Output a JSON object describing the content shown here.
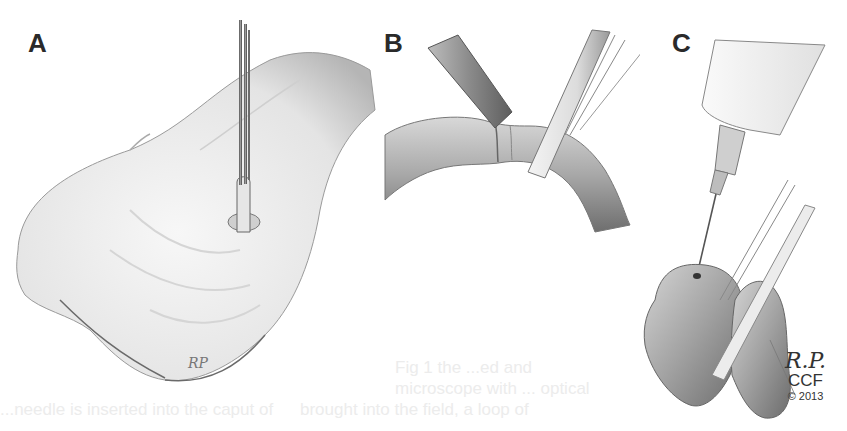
{
  "figure": {
    "panels": [
      {
        "label": "A",
        "description": "Scrotal skin incision with forceps grasping exposed structure"
      },
      {
        "label": "B",
        "description": "Tubular structure held between instrument and rod"
      },
      {
        "label": "C",
        "description": "Syringe needle inserted into tissue beside rod"
      }
    ],
    "artist_mark_a": "RP",
    "signature": {
      "initials": "R.P.",
      "organization": "CCF",
      "copyright": "© 2013"
    },
    "bleed_through_text": [
      "Fig 1  the ...ed and",
      "microscope with ... optical",
      "brought into the field, a loop of",
      "...needle is inserted into the caput of"
    ],
    "colors": {
      "background": "#ffffff",
      "ink": "#2a2a2a",
      "tissue_light": "#e8e8e8",
      "tissue_shadow": "#8a8a8a"
    }
  }
}
